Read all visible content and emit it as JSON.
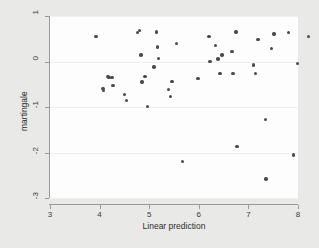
{
  "figure": {
    "background_color": "#e9e9e7",
    "panel_color": "#fdfdfd",
    "axis_color": "#9a9a98",
    "point_color": "#4a4a4f",
    "gridline_color": "#efefef"
  },
  "chart_data": {
    "type": "scatter",
    "title": "",
    "xlabel": "Linear prediction",
    "ylabel": "martingale",
    "xlim": [
      3,
      8
    ],
    "ylim": [
      -3,
      1
    ],
    "xticks": [
      3,
      4,
      5,
      6,
      7,
      8
    ],
    "xticklabels": [
      "3",
      "4",
      "5",
      "6",
      "7",
      "8"
    ],
    "yticks": [
      1,
      0,
      -1,
      -2,
      -3
    ],
    "yticklabels": [
      "1",
      "0",
      "-1",
      "-2",
      "-3"
    ],
    "grid": "horizontal",
    "legend": "none",
    "marker": "filled-circle",
    "series": [
      {
        "name": "martingale residuals",
        "points": [
          [
            3.04,
            0.82
          ],
          [
            3.18,
            -0.33
          ],
          [
            3.19,
            -0.38
          ],
          [
            3.28,
            -0.06
          ],
          [
            3.3,
            -0.09
          ],
          [
            3.36,
            -0.09
          ],
          [
            3.38,
            -0.27
          ],
          [
            3.62,
            -0.46
          ],
          [
            3.66,
            -0.59
          ],
          [
            3.88,
            0.9
          ],
          [
            3.92,
            0.94
          ],
          [
            3.95,
            0.41
          ],
          [
            3.97,
            -0.19
          ],
          [
            4.03,
            -0.06
          ],
          [
            4.08,
            -0.73
          ],
          [
            4.21,
            0.14
          ],
          [
            4.26,
            0.91
          ],
          [
            4.28,
            0.58
          ],
          [
            4.3,
            0.33
          ],
          [
            4.5,
            -0.35
          ],
          [
            4.54,
            -0.51
          ],
          [
            4.57,
            -0.18
          ],
          [
            4.66,
            0.66
          ],
          [
            4.78,
            -1.94
          ],
          [
            5.1,
            -0.11
          ],
          [
            5.32,
            0.81
          ],
          [
            5.34,
            0.26
          ],
          [
            5.45,
            0.62
          ],
          [
            5.5,
            0.32
          ],
          [
            5.54,
            0.0
          ],
          [
            5.58,
            0.41
          ],
          [
            5.78,
            0.48
          ],
          [
            5.8,
            0.0
          ],
          [
            5.86,
            0.91
          ],
          [
            5.88,
            -1.6
          ],
          [
            6.22,
            0.19
          ],
          [
            6.25,
            0.0
          ],
          [
            6.31,
            0.75
          ],
          [
            6.46,
            -1.01
          ],
          [
            6.47,
            -2.32
          ],
          [
            6.58,
            0.55
          ],
          [
            6.63,
            0.87
          ],
          [
            6.92,
            0.9
          ],
          [
            7.02,
            -1.79
          ],
          [
            7.1,
            0.22
          ],
          [
            7.32,
            0.82
          ],
          [
            7.58,
            0.17
          ]
        ]
      }
    ]
  }
}
